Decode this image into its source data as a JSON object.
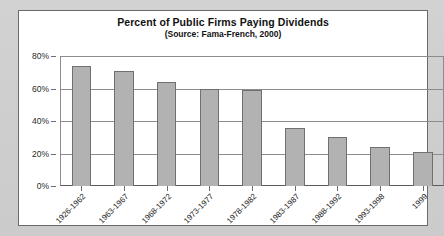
{
  "chart_data": {
    "type": "bar",
    "title": "Percent of Public Firms Paying Dividends",
    "subtitle": "(Source: Fama-French, 2000)",
    "xlabel": "",
    "ylabel": "",
    "ylim": [
      0,
      80
    ],
    "grid": true,
    "legend": "none",
    "y_ticks": [
      "0%",
      "20%",
      "40%",
      "60%",
      "80%"
    ],
    "y_tick_values": [
      0,
      20,
      40,
      60,
      80
    ],
    "categories": [
      "1926-1962",
      "1963-1967",
      "1968-1972",
      "1973-1977",
      "1978-1982",
      "1983-1987",
      "1988-1992",
      "1993-1998",
      "1999"
    ],
    "values": [
      74,
      71,
      64,
      60,
      59,
      36,
      30,
      24,
      21
    ],
    "bar_color": "#b2b2b2",
    "bar_border_color": "#70706f",
    "axis_color": "#8c8c8c",
    "plot_background": "#ffffff",
    "frame_border_color": "#6a6a6a",
    "page_background": "#cdcdcd"
  }
}
